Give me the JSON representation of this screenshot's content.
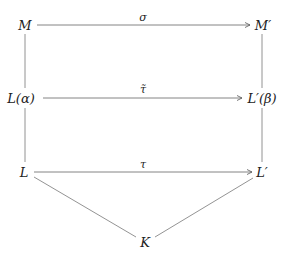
{
  "diagram": {
    "type": "commutative-diagram",
    "nodes": {
      "M": "M",
      "M_prime": "M′",
      "L_alpha": "L(α)",
      "L_prime_beta": "L′(β)",
      "L": "L",
      "L_prime": "L′",
      "K": "K"
    },
    "arrow_labels": {
      "sigma": "σ",
      "tau_tilde": "τ̃",
      "tau": "τ"
    },
    "edges": [
      {
        "from": "M",
        "to": "M′",
        "label": "σ",
        "style": "arrow"
      },
      {
        "from": "L(α)",
        "to": "L′(β)",
        "label": "τ̃",
        "style": "arrow"
      },
      {
        "from": "L",
        "to": "L′",
        "label": "τ",
        "style": "arrow"
      },
      {
        "from": "M",
        "to": "L(α)",
        "style": "line"
      },
      {
        "from": "L(α)",
        "to": "L",
        "style": "line"
      },
      {
        "from": "M′",
        "to": "L′(β)",
        "style": "line"
      },
      {
        "from": "L′(β)",
        "to": "L′",
        "style": "line"
      },
      {
        "from": "L",
        "to": "K",
        "style": "line"
      },
      {
        "from": "L′",
        "to": "K",
        "style": "line"
      }
    ],
    "colors": {
      "stroke": "#555555",
      "text": "#222222"
    }
  }
}
